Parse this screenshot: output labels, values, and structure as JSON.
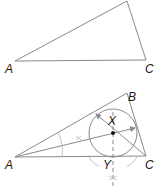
{
  "figure_top": {
    "labels": {
      "A": "A",
      "C": "C"
    },
    "vertices": {
      "A": [
        15,
        61
      ],
      "B": [
        127,
        1
      ],
      "C": [
        146,
        60
      ]
    }
  },
  "figure_bottom": {
    "labels": {
      "A": "A",
      "B": "B",
      "C": "C",
      "X": "X",
      "Y": "Y"
    },
    "vertices": {
      "A": [
        15,
        157
      ],
      "B": [
        127,
        93
      ],
      "C": [
        146,
        156
      ]
    },
    "incenter": [
      113,
      133
    ],
    "inradius": 24
  },
  "colors": {
    "line": "#8a8a8a",
    "construction": "#b5b5b5",
    "text": "#1a1a1a"
  }
}
